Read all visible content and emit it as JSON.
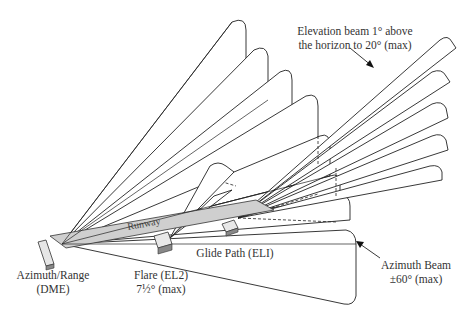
{
  "labels": {
    "elevation_line1": "Elevation beam 1° above",
    "elevation_line2": "the horizon to 20° (max)",
    "azimuth_beam_line1": "Azimuth Beam",
    "azimuth_beam_line2": "±60° (max)",
    "azimuth_range_line1": "Azimuth/Range",
    "azimuth_range_line2": "(DME)",
    "flare_line1": "Flare (EL2)",
    "flare_line2": "7½° (max)",
    "glide_path": "Glide Path (ELI)",
    "runway": "Runway"
  },
  "colors": {
    "runway_fill": "#cfcfcf",
    "stroke": "#222222",
    "background": "#ffffff"
  }
}
